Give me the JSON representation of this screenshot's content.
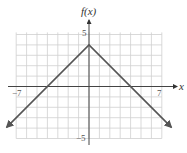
{
  "chart_data": {
    "type": "line",
    "title": "",
    "xlabel": "x",
    "ylabel": "f(x)",
    "xlim": [
      -7,
      7
    ],
    "ylim": [
      -5,
      5
    ],
    "grid": true,
    "tick_labels": {
      "x": [
        "-7",
        "7"
      ],
      "y": [
        "5",
        "-5"
      ]
    },
    "series": [
      {
        "name": "f(x) = -|x| + 4",
        "x": [
          -7.9,
          0,
          7.9
        ],
        "y": [
          -3.9,
          4,
          -3.9
        ],
        "arrows_at_ends": true,
        "color": "#555555"
      }
    ],
    "key_points": {
      "vertex": [
        0,
        4
      ],
      "x_intercepts": [
        -4,
        4
      ]
    }
  },
  "labels": {
    "x_axis": "x",
    "y_axis": "f(x)",
    "x_min": "−7",
    "x_max": "7",
    "y_max": "5",
    "y_min": "−5"
  }
}
